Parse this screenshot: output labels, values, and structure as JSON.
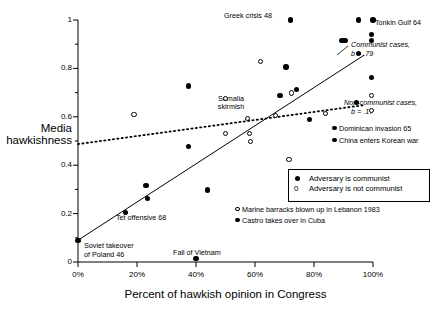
{
  "chart_data": {
    "type": "scatter",
    "title": "",
    "xlabel": "Percent of hawkish opinion in Congress",
    "ylabel": "Media hawkishness",
    "ylabel_line1": "Media",
    "ylabel_line2": "hawkishness",
    "xlim": [
      0,
      100
    ],
    "ylim": [
      0,
      1
    ],
    "grid": false,
    "xticks": [
      "0%",
      "20%",
      "40%",
      "60%",
      "80%",
      "100%"
    ],
    "xtick_values": [
      0,
      20,
      40,
      60,
      80,
      100
    ],
    "yticks": [
      "0",
      "0.2",
      "0.4",
      "0.6",
      "0.8",
      "1"
    ],
    "ytick_values": [
      0,
      0.2,
      0.4,
      0.6,
      0.8,
      1
    ],
    "yminor_values": [
      0.1,
      0.3,
      0.5,
      0.7,
      0.9
    ],
    "legend_position": "lower-right-inside-box",
    "series": [
      {
        "name": "Adversary is communist",
        "marker": "filled-circle",
        "points": [
          {
            "x": 0.0,
            "y": 0.09
          },
          {
            "x": 16.0,
            "y": 0.205
          },
          {
            "x": 23.0,
            "y": 0.315
          },
          {
            "x": 23.5,
            "y": 0.262
          },
          {
            "x": 37.5,
            "y": 0.478
          },
          {
            "x": 37.5,
            "y": 0.728
          },
          {
            "x": 40.0,
            "y": 0.015
          },
          {
            "x": 44.0,
            "y": 0.298
          },
          {
            "x": 68.5,
            "y": 0.688
          },
          {
            "x": 70.5,
            "y": 0.805
          },
          {
            "x": 72.0,
            "y": 1.0
          },
          {
            "x": 74.0,
            "y": 0.712
          },
          {
            "x": 78.5,
            "y": 0.588
          },
          {
            "x": 89.5,
            "y": 0.915
          },
          {
            "x": 90.5,
            "y": 0.915
          },
          {
            "x": 94.5,
            "y": 0.658
          },
          {
            "x": 95.0,
            "y": 0.862
          },
          {
            "x": 95.0,
            "y": 1.0
          },
          {
            "x": 99.5,
            "y": 0.94
          },
          {
            "x": 99.5,
            "y": 0.915
          },
          {
            "x": 100.0,
            "y": 1.0
          },
          {
            "x": 99.5,
            "y": 0.762
          }
        ]
      },
      {
        "name": "Adversary is not communist",
        "marker": "open-circle",
        "points": [
          {
            "x": 19.0,
            "y": 0.61
          },
          {
            "x": 50.0,
            "y": 0.677
          },
          {
            "x": 50.0,
            "y": 0.532
          },
          {
            "x": 57.5,
            "y": 0.592
          },
          {
            "x": 58.0,
            "y": 0.532
          },
          {
            "x": 58.5,
            "y": 0.498
          },
          {
            "x": 62.0,
            "y": 0.828
          },
          {
            "x": 67.0,
            "y": 0.605
          },
          {
            "x": 71.5,
            "y": 0.422
          },
          {
            "x": 72.5,
            "y": 0.698
          },
          {
            "x": 84.0,
            "y": 0.612
          },
          {
            "x": 99.5,
            "y": 0.688
          },
          {
            "x": 99.5,
            "y": 0.625
          }
        ]
      }
    ],
    "fit_lines": [
      {
        "name": "Communist cases",
        "slope_label": "b = .79",
        "style": "solid",
        "x0": 0,
        "y0": 0.09,
        "x1": 97,
        "y1": 0.855
      },
      {
        "name": "Non-communist cases",
        "slope_label": "b = .17",
        "style": "dotted",
        "x0": 0,
        "y0": 0.487,
        "x1": 97,
        "y1": 0.648
      }
    ],
    "annotations": [
      {
        "text": "Greek crisis 48",
        "x": 72,
        "y": 1.0
      },
      {
        "text": "Tonkin Gulf 64",
        "x": 100,
        "y": 1.0
      },
      {
        "text": "Somalia\nskirmish",
        "x": 60,
        "y": 0.67
      },
      {
        "text": "Tet offensive 68",
        "x": 16,
        "y": 0.205
      },
      {
        "text": "Soviet takeover\nof Poland 46",
        "x": 0,
        "y": 0.09
      },
      {
        "text": "Fall of Vietnam",
        "x": 40,
        "y": 0.015
      },
      {
        "text": "Dominican invasion 65",
        "x": 95,
        "y": 0.548
      },
      {
        "text": "China enters Korean war",
        "x": 95,
        "y": 0.5
      },
      {
        "text": "Marine barracks blown up in Lebanon 1983",
        "x": 70,
        "y": 0.185
      },
      {
        "text": "Castro takes over in Cuba",
        "x": 70,
        "y": 0.145
      }
    ]
  },
  "labels": {
    "ylabel_line1": "Media",
    "ylabel_line2": "hawkishness",
    "xlabel": "Percent of hawkish opinion in Congress",
    "ytick_0": "0",
    "ytick_02": "0.2",
    "ytick_04": "0.4",
    "ytick_06": "0.6",
    "ytick_08": "0.8",
    "ytick_1": "1",
    "xtick_0": "0%",
    "xtick_20": "20%",
    "xtick_40": "40%",
    "xtick_60": "60%",
    "xtick_80": "80%",
    "xtick_100": "100%"
  },
  "annotations": {
    "greek_crisis": "Greek crisis 48",
    "tonkin_gulf": "Tonkin Gulf 64",
    "somalia_1": "Somalia",
    "somalia_2": "skirmish",
    "tet_offensive": "Tet offensive 68",
    "soviet_1": "Soviet takeover",
    "soviet_2": "of Poland 46",
    "fall_vietnam": "Fall of Vietnam",
    "dominican": "Dominican invasion 65",
    "china_korea": "China enters Korean war",
    "marine_barracks": "Marine barracks blown up in Lebanon 1983",
    "castro": "Castro takes over in Cuba"
  },
  "fit_labels": {
    "communist_name": "Communist cases,",
    "communist_b": "b = .79",
    "noncommunist_name": "Non-communist cases,",
    "noncommunist_b": "b = .17"
  },
  "legend": {
    "item_filled": "Adversary is communist",
    "item_open": "Adversary is not communist",
    "open_glyph": "0"
  },
  "colors": {
    "ink": "#000000",
    "background": "#ffffff",
    "axis": "#000000"
  }
}
